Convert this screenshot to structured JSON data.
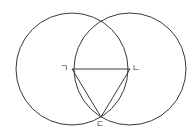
{
  "diagram": {
    "stroke_color": "#3a3a3a",
    "circles": [
      {
        "name": "circle-left",
        "cx": 72,
        "cy": 69,
        "r": 56
      },
      {
        "name": "circle-right",
        "cx": 130,
        "cy": 69,
        "r": 56
      }
    ],
    "points": {
      "g": {
        "label": "ㄱ",
        "x": 72,
        "y": 69
      },
      "n": {
        "label": "ㄴ",
        "x": 130,
        "y": 69
      },
      "d": {
        "label": "ㄷ",
        "x": 101,
        "y": 117
      }
    },
    "segments": [
      [
        "g",
        "n"
      ],
      [
        "g",
        "d"
      ],
      [
        "n",
        "d"
      ]
    ]
  }
}
